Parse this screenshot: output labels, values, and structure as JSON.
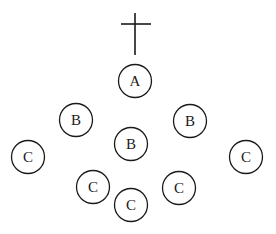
{
  "diagram": {
    "cross": {
      "icon": "cross-icon",
      "vertical": {
        "x": 135,
        "y1": 13,
        "y2": 55
      },
      "horizontal": {
        "y": 24,
        "x1": 121,
        "x2": 151
      }
    },
    "nodes": [
      {
        "id": "a",
        "label": "A",
        "cx": 135,
        "cy": 81,
        "r": 16.5
      },
      {
        "id": "b-left",
        "label": "B",
        "cx": 76,
        "cy": 120,
        "r": 16.5
      },
      {
        "id": "b-center",
        "label": "B",
        "cx": 131,
        "cy": 144,
        "r": 16.5
      },
      {
        "id": "b-right",
        "label": "B",
        "cx": 190,
        "cy": 121,
        "r": 16.5
      },
      {
        "id": "c-far-left",
        "label": "C",
        "cx": 28,
        "cy": 157,
        "r": 16.5
      },
      {
        "id": "c-far-right",
        "label": "C",
        "cx": 246,
        "cy": 157,
        "r": 16.5
      },
      {
        "id": "c-lower-left",
        "label": "C",
        "cx": 93,
        "cy": 187,
        "r": 16.5
      },
      {
        "id": "c-lower-right",
        "label": "C",
        "cx": 179,
        "cy": 188,
        "r": 16.5
      },
      {
        "id": "c-bottom",
        "label": "C",
        "cx": 131,
        "cy": 205,
        "r": 16.5
      }
    ],
    "colors": {
      "stroke": "#1a1a1a",
      "background": "#ffffff"
    }
  }
}
